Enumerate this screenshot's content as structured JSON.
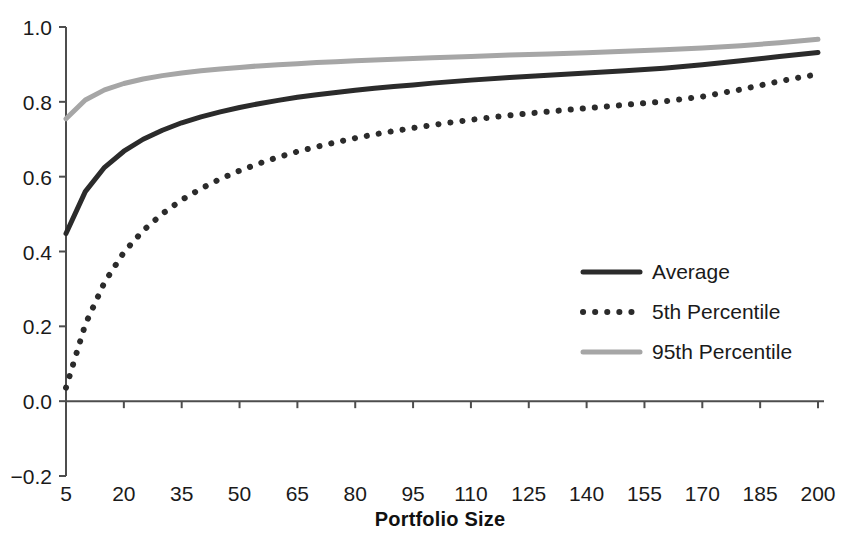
{
  "chart_data": {
    "type": "line",
    "title": "",
    "xlabel": "Portfolio Size",
    "ylabel": "",
    "xlim": [
      5,
      200
    ],
    "ylim": [
      -0.2,
      1.0
    ],
    "grid": false,
    "legend_position": "center-right",
    "xticks": [
      "5",
      "20",
      "35",
      "50",
      "65",
      "80",
      "95",
      "110",
      "125",
      "140",
      "155",
      "170",
      "185",
      "200"
    ],
    "yticks": [
      "-0.2",
      "0.0",
      "0.2",
      "0.4",
      "0.6",
      "0.8",
      "1.0"
    ],
    "x": [
      5,
      10,
      15,
      20,
      25,
      30,
      35,
      40,
      45,
      50,
      55,
      60,
      65,
      70,
      75,
      80,
      85,
      90,
      95,
      100,
      110,
      120,
      130,
      140,
      150,
      160,
      170,
      180,
      190,
      200
    ],
    "series": [
      {
        "name": "Average",
        "style": "solid",
        "color": "#2b2b2b",
        "values": [
          0.448,
          0.56,
          0.625,
          0.668,
          0.7,
          0.724,
          0.744,
          0.76,
          0.773,
          0.785,
          0.795,
          0.804,
          0.812,
          0.819,
          0.825,
          0.831,
          0.836,
          0.841,
          0.845,
          0.85,
          0.858,
          0.865,
          0.871,
          0.877,
          0.883,
          0.89,
          0.899,
          0.91,
          0.921,
          0.932
        ]
      },
      {
        "name": "5th Percentile",
        "style": "dotted",
        "color": "#2b2b2b",
        "values": [
          0.036,
          0.205,
          0.318,
          0.398,
          0.456,
          0.501,
          0.538,
          0.568,
          0.594,
          0.616,
          0.635,
          0.652,
          0.667,
          0.68,
          0.692,
          0.703,
          0.713,
          0.722,
          0.73,
          0.738,
          0.752,
          0.764,
          0.774,
          0.783,
          0.792,
          0.801,
          0.814,
          0.833,
          0.855,
          0.874
        ]
      },
      {
        "name": "95th Percentile",
        "style": "solid",
        "color": "#a6a6a6",
        "values": [
          0.755,
          0.805,
          0.832,
          0.849,
          0.861,
          0.87,
          0.877,
          0.883,
          0.888,
          0.892,
          0.896,
          0.899,
          0.902,
          0.905,
          0.907,
          0.91,
          0.912,
          0.914,
          0.916,
          0.918,
          0.921,
          0.925,
          0.928,
          0.931,
          0.935,
          0.939,
          0.944,
          0.95,
          0.958,
          0.967
        ]
      }
    ]
  },
  "legend": {
    "items": [
      {
        "label": "Average"
      },
      {
        "label": "5th Percentile"
      },
      {
        "label": "95th Percentile"
      }
    ]
  },
  "axes": {
    "x_title": "Portfolio Size",
    "axis_color": "#4d4d4d"
  }
}
